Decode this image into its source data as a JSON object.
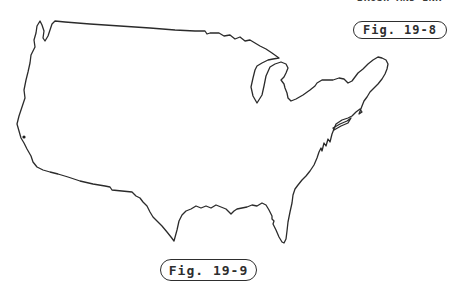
{
  "page": {
    "background": "#ffffff",
    "ink_color": "#2b2b2b"
  },
  "clipped_header": {
    "text": "BRUSH AND INK"
  },
  "figures": {
    "top": {
      "label": "Fig. 19-8"
    },
    "bottom": {
      "label": "Fig. 19-9"
    }
  },
  "map": {
    "subject": "blank outline map of the continental United States",
    "outline_path": "M 40,21 L 37,26 L 36,33 L 34,40 L 35,47 L 31,55 L 30,63 L 28,72 L 26,80 L 24,90 L 25,98 L 22,107 L 19,116 L 17,124 L 19,131 L 21,138 L 24,143 L 27,149 L 31,156 L 33,162 L 37,167 L 43,170 L 50,172 L 58,174 L 68,177 L 80,181 L 93,184 L 105,186 L 110,187 L 112,190 L 122,191 L 132,192 L 136,196 L 140,198 L 143,202 L 147,206 L 150,212 L 153,217 L 158,222 L 162,226 L 167,232 L 171,237 L 174,241 L 177,230 L 179,221 L 182,215 L 186,211 L 191,209 L 196,206 L 201,208 L 206,206 L 211,208 L 216,205 L 221,207 L 226,209 L 231,214 L 234,211 L 237,209 L 242,208 L 247,207 L 252,205 L 257,206 L 262,203 L 266,205 L 269,210 L 272,216 L 272,219 L 274,221 L 273,224 L 276,230 L 279,237 L 282,242 L 284,243 L 286,239 L 287,231 L 288,222 L 290,212 L 292,203 L 293,195 L 295,189 L 298,185 L 302,180 L 306,176 L 310,171 L 314,165 L 317,158 L 319,152 L 321,148 L 322,151 L 324,143 L 326,146 L 328,139 L 330,142 L 332,134 L 334,129 L 336,124 L 342,120 L 348,118 L 352,116 L 356,112 L 360,109 L 362,112 L 359,114 L 362,106 L 364,101 L 367,97 L 370,92 L 374,88 L 378,84 L 382,79 L 385,74 L 387,69 L 388,64 L 386,60 L 382,58 L 378,57 L 373,60 L 368,64 L 363,69 L 358,73 L 352,81 L 348,83 L 344,79 L 339,78 L 333,80 L 328,80 L 322,80 L 317,83 L 315,86 L 310,90 L 303,95 L 296,99 L 291,101 L 288,98 L 287,93 L 285,88 L 284,84 L 281,80 L 284,77 L 286,73 L 288,68 L 286,64 L 281,62 L 275,64 L 270,67 L 266,76 L 264,86 L 262,95 L 257,103 L 253,96 L 251,87 L 253,78 L 255,70 L 257,66 L 262,63 L 268,60 L 273,59 L 279,58 L 272,53 L 266,49 L 260,46 L 255,43 L 250,40 L 245,41 L 240,37 L 235,39 L 230,35 L 224,36 L 219,33 L 210,33 L 207,34 L 205,31 L 195,31 L 175,30 L 150,28 L 120,26 L 90,24 L 65,22 L 55,21 L 52,24 L 50,30 L 48,36 L 45,41 L 43,38 L 44,31 L 42,25 Z",
    "long_island_path": "M 333,128 L 340,124 L 347,121 L 351,118 L 348,123 L 341,126 L 334,130 Z",
    "san_francisco_mark": {
      "cx": "24",
      "cy": "137",
      "r": "1.6"
    }
  }
}
